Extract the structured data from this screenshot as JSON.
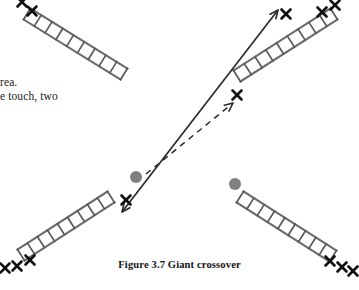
{
  "figure": {
    "caption": "Figure 3.7 Giant crossover",
    "body_text_lines": [
      "rea.",
      "e touch, two"
    ],
    "colors": {
      "ladder_rail": "#6b6b6b",
      "ladder_rung": "#5a5a5a",
      "marker_x": "#111111",
      "player_dot": "#808080",
      "arrow_solid": "#2b2b2b",
      "arrow_dashed": "#2b2b2b",
      "page_background": "#ffffff",
      "text": "#1a1a1a"
    },
    "ladders": [
      {
        "id": "ladder-top-left",
        "label": "top-left ladder",
        "x1": 27,
        "y1": 14,
        "x2": 124,
        "y2": 74,
        "width": 13,
        "rungs": 9
      },
      {
        "id": "ladder-top-right",
        "label": "top-right ladder",
        "x1": 237,
        "y1": 76,
        "x2": 334,
        "y2": 14,
        "width": 13,
        "rungs": 9
      },
      {
        "id": "ladder-bottom-left",
        "label": "bottom-left ladder",
        "x1": 111,
        "y1": 197,
        "x2": 21,
        "y2": 255,
        "width": 13,
        "rungs": 9
      },
      {
        "id": "ladder-bottom-right",
        "label": "bottom-right ladder",
        "x1": 240,
        "y1": 197,
        "x2": 333,
        "y2": 256,
        "width": 13,
        "rungs": 9
      }
    ],
    "markers": [
      {
        "id": "x-top-left-1",
        "label": "cone marker",
        "x": 22,
        "y": 2,
        "size": 9
      },
      {
        "id": "x-top-left-2",
        "label": "cone marker",
        "x": 32,
        "y": 11,
        "size": 9
      },
      {
        "id": "x-top-right-1",
        "label": "cone marker",
        "x": 322,
        "y": 12,
        "size": 9
      },
      {
        "id": "x-top-right-2",
        "label": "cone marker",
        "x": 335,
        "y": 5,
        "size": 9
      },
      {
        "id": "x-center-upper",
        "label": "cone marker",
        "x": 286,
        "y": 14,
        "size": 9
      },
      {
        "id": "x-center-lower",
        "label": "cone marker",
        "x": 237,
        "y": 95,
        "size": 9
      },
      {
        "id": "x-bottom-left-top",
        "label": "cone marker",
        "x": 126,
        "y": 200,
        "size": 9
      },
      {
        "id": "x-bottom-left-1",
        "label": "cone marker",
        "x": 5,
        "y": 268,
        "size": 9
      },
      {
        "id": "x-bottom-left-2",
        "label": "cone marker",
        "x": 17,
        "y": 266,
        "size": 9
      },
      {
        "id": "x-bottom-left-3",
        "label": "cone marker",
        "x": 30,
        "y": 260,
        "size": 9
      },
      {
        "id": "x-bottom-right-1",
        "label": "cone marker",
        "x": 330,
        "y": 261,
        "size": 9
      },
      {
        "id": "x-bottom-right-2",
        "label": "cone marker",
        "x": 342,
        "y": 267,
        "size": 9
      },
      {
        "id": "x-bottom-right-3",
        "label": "cone marker",
        "x": 353,
        "y": 271,
        "size": 9
      }
    ],
    "players": [
      {
        "id": "player-dot-left",
        "label": "player position left",
        "cx": 136,
        "cy": 177,
        "r": 6
      },
      {
        "id": "player-dot-right",
        "label": "player position right",
        "cx": 235,
        "cy": 184,
        "r": 6
      }
    ],
    "arrows": [
      {
        "id": "arrow-solid-crossover",
        "label": "solid double-headed crossover path",
        "style": "solid",
        "heads": "both",
        "x1": 122,
        "y1": 212,
        "x2": 278,
        "y2": 10
      },
      {
        "id": "arrow-dashed-crossover",
        "label": "dashed crossover path",
        "style": "dashed",
        "heads": "end",
        "x1": 146,
        "y1": 174,
        "x2": 233,
        "y2": 103
      }
    ]
  }
}
